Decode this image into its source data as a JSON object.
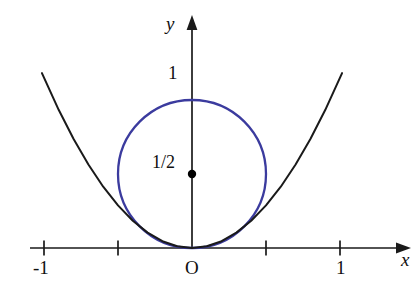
{
  "figure": {
    "kind": "math-diagram",
    "width": 418,
    "height": 289,
    "background_color": "#ffffff"
  },
  "colors": {
    "curve_parabola": "#1a1a1a",
    "curve_circle": "#3b3b9e",
    "axis": "#1a1a1a",
    "text": "#101010",
    "center_dot": "#000000"
  },
  "labels": {
    "y_axis": "y",
    "x_axis": "x",
    "origin": "O",
    "y_one": "1",
    "center_value": "1/2",
    "x_neg_one": "-1",
    "x_one": "1"
  },
  "chart_data": {
    "type": "line",
    "title": "",
    "xlabel": "x",
    "ylabel": "y",
    "xlim": [
      -1.095,
      1.405
    ],
    "ylim": [
      -0.275,
      1.555
    ],
    "grid": false,
    "legend": "none",
    "axes": {
      "x_ticks": [
        -1,
        -0.5,
        0.5,
        1
      ],
      "x_tick_labels": [
        "-1",
        "",
        "",
        "1"
      ],
      "y_ticks": [
        1
      ],
      "y_tick_labels": [
        "1"
      ],
      "origin_label": "O",
      "x_axis_arrow": true,
      "y_axis_arrow": true
    },
    "series": [
      {
        "name": "parabola",
        "type": "line",
        "color": "#1a1a1a",
        "equation": "y = 1.15 x^2",
        "x_range": [
          -1.014,
          1.014
        ],
        "x": [
          -1.014,
          -0.9,
          -0.8,
          -0.7,
          -0.6,
          -0.5,
          -0.4,
          -0.3,
          -0.2,
          -0.1,
          0,
          0.1,
          0.2,
          0.3,
          0.4,
          0.5,
          0.6,
          0.7,
          0.8,
          0.9,
          1.014
        ],
        "values": [
          1.182,
          0.932,
          0.736,
          0.564,
          0.414,
          0.288,
          0.184,
          0.104,
          0.046,
          0.012,
          0,
          0.012,
          0.046,
          0.104,
          0.184,
          0.288,
          0.414,
          0.564,
          0.736,
          0.932,
          1.182
        ]
      },
      {
        "name": "circle",
        "type": "circle",
        "color": "#3b3b9e",
        "equation": "x^2 + (y - 1/2)^2 = (1/2)^2",
        "center": [
          0,
          0.5
        ],
        "radius": 0.5,
        "tangent_point": [
          0,
          0
        ]
      }
    ],
    "annotations": [
      {
        "name": "center-dot",
        "point": [
          0,
          0.5
        ],
        "label": "1/2",
        "marker": "filled-circle"
      },
      {
        "name": "circle-top",
        "point": [
          0,
          1
        ],
        "label": "1",
        "marker": "none"
      }
    ]
  }
}
